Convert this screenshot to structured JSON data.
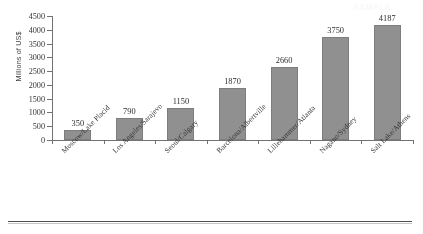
{
  "chart_data": {
    "type": "bar",
    "title": "",
    "xlabel": "",
    "ylabel": "Millions of US$",
    "ylim": [
      0,
      4500
    ],
    "ytick_values": [
      0,
      500,
      1000,
      1500,
      2000,
      2500,
      3000,
      3500,
      4000,
      4500
    ],
    "ytick_labels": [
      "0",
      "500",
      "1000",
      "1500",
      "2000",
      "2500",
      "3000",
      "3500",
      "4000",
      "4500"
    ],
    "grid": false,
    "legend": false,
    "bar_color": "#8e8e8e",
    "data_labels_shown": true,
    "categories": [
      "Moscow/Lake Placid",
      "Los Angeles/Sarajevo",
      "Seoul/Calgary",
      "Barcelona/Albertville",
      "Lillehammer/Atlanta",
      "Nagano/Sydney",
      "Salt Lake/Athens"
    ],
    "values": [
      350,
      790,
      1150,
      1870,
      2660,
      3750,
      4187
    ],
    "value_labels": [
      "350",
      "790",
      "1150",
      "1870",
      "2660",
      "3750",
      "4187"
    ]
  },
  "watermark": {
    "text": "SAMPLE"
  }
}
